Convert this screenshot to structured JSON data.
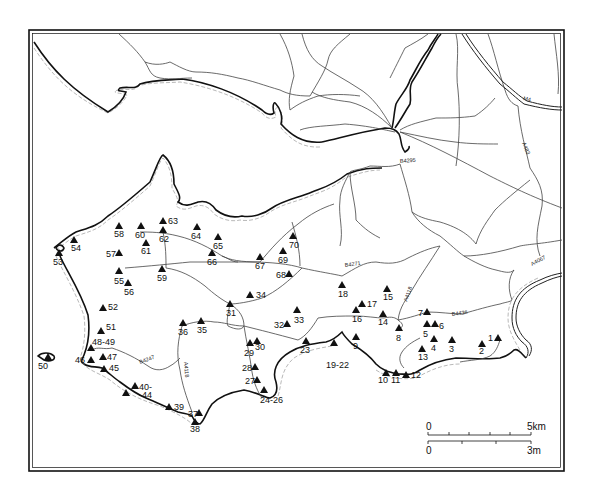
{
  "map": {
    "road_labels": {
      "m4": "M4",
      "a483": "A483",
      "b4295": "B4295",
      "b4271": "B4271",
      "a4067": "A4067",
      "a4118_north": "A4118",
      "b4436": "B4436",
      "b4247": "B4247",
      "a4118_south": "A4118"
    },
    "sites": [
      {
        "label": "1",
        "x": 498,
        "y": 338,
        "lx": 488,
        "ly": 341
      },
      {
        "label": "2",
        "x": 482,
        "y": 344,
        "lx": 479,
        "ly": 354
      },
      {
        "label": "3",
        "x": 452,
        "y": 340,
        "lx": 449,
        "ly": 352
      },
      {
        "label": "4",
        "x": 434,
        "y": 339,
        "lx": 431,
        "ly": 351
      },
      {
        "label": "5",
        "x": 427,
        "y": 324,
        "lx": 423,
        "ly": 337
      },
      {
        "label": "6",
        "x": 435,
        "y": 324,
        "lx": 439,
        "ly": 329
      },
      {
        "label": "7",
        "x": 427,
        "y": 312,
        "lx": 418,
        "ly": 316
      },
      {
        "label": "8",
        "x": 399,
        "y": 328,
        "lx": 396,
        "ly": 341
      },
      {
        "label": "9",
        "x": 356,
        "y": 337,
        "lx": 353,
        "ly": 349
      },
      {
        "label": "10",
        "x": 386,
        "y": 373,
        "lx": 378,
        "ly": 383
      },
      {
        "label": "11",
        "x": 396,
        "y": 373,
        "lx": 391,
        "ly": 383
      },
      {
        "label": "12",
        "x": 406,
        "y": 375,
        "lx": 411,
        "ly": 378
      },
      {
        "label": "13",
        "x": 422,
        "y": 349,
        "lx": 418,
        "ly": 360
      },
      {
        "label": "14",
        "x": 383,
        "y": 314,
        "lx": 378,
        "ly": 325
      },
      {
        "label": "15",
        "x": 387,
        "y": 289,
        "lx": 383,
        "ly": 300
      },
      {
        "label": "16",
        "x": 356,
        "y": 310,
        "lx": 352,
        "ly": 322
      },
      {
        "label": "17",
        "x": 362,
        "y": 304,
        "lx": 367,
        "ly": 307
      },
      {
        "label": "18",
        "x": 342,
        "y": 285,
        "lx": 338,
        "ly": 297
      },
      {
        "label": "19-22",
        "x": 334,
        "y": 343,
        "lx": 326,
        "ly": 368
      },
      {
        "label": "23",
        "x": 306,
        "y": 341,
        "lx": 300,
        "ly": 353
      },
      {
        "label": "24-26",
        "x": 264,
        "y": 390,
        "lx": 260,
        "ly": 403
      },
      {
        "label": "27",
        "x": 257,
        "y": 380,
        "lx": 245,
        "ly": 384
      },
      {
        "label": "28",
        "x": 255,
        "y": 367,
        "lx": 242,
        "ly": 371
      },
      {
        "label": "29",
        "x": 250,
        "y": 343,
        "lx": 244,
        "ly": 356
      },
      {
        "label": "30",
        "x": 257,
        "y": 341,
        "lx": 255,
        "ly": 350
      },
      {
        "label": "31",
        "x": 230,
        "y": 304,
        "lx": 226,
        "ly": 316
      },
      {
        "label": "32",
        "x": 287,
        "y": 324,
        "lx": 274,
        "ly": 328
      },
      {
        "label": "33",
        "x": 297,
        "y": 310,
        "lx": 294,
        "ly": 323
      },
      {
        "label": "34",
        "x": 250,
        "y": 295,
        "lx": 256,
        "ly": 298
      },
      {
        "label": "35",
        "x": 201,
        "y": 321,
        "lx": 197,
        "ly": 333
      },
      {
        "label": "36",
        "x": 183,
        "y": 323,
        "lx": 178,
        "ly": 335
      },
      {
        "label": "37",
        "x": 199,
        "y": 413,
        "lx": 188,
        "ly": 417
      },
      {
        "label": "38",
        "x": 195,
        "y": 422,
        "lx": 190,
        "ly": 432
      },
      {
        "label": "39",
        "x": 169,
        "y": 407,
        "lx": 174,
        "ly": 410
      },
      {
        "label": "40-",
        "x": 135,
        "y": 386,
        "lx": 139,
        "ly": 390
      },
      {
        "label": "-44",
        "x": 126,
        "y": 393,
        "lx": 139,
        "ly": 398
      },
      {
        "label": "45",
        "x": 104,
        "y": 369,
        "lx": 109,
        "ly": 371
      },
      {
        "label": "46",
        "x": 91,
        "y": 360,
        "lx": 75,
        "ly": 363
      },
      {
        "label": "47",
        "x": 103,
        "y": 357,
        "lx": 107,
        "ly": 360
      },
      {
        "label": "48-49",
        "x": 91,
        "y": 348,
        "lx": 92,
        "ly": 345
      },
      {
        "label": "50",
        "x": 48,
        "y": 357,
        "lx": 38,
        "ly": 369
      },
      {
        "label": "51",
        "x": 101,
        "y": 331,
        "lx": 106,
        "ly": 330
      },
      {
        "label": "52",
        "x": 103,
        "y": 308,
        "lx": 108,
        "ly": 310
      },
      {
        "label": "53",
        "x": 59,
        "y": 253,
        "lx": 53,
        "ly": 265
      },
      {
        "label": "54",
        "x": 74,
        "y": 240,
        "lx": 71,
        "ly": 251
      },
      {
        "label": "55",
        "x": 119,
        "y": 271,
        "lx": 114,
        "ly": 284
      },
      {
        "label": "56",
        "x": 128,
        "y": 283,
        "lx": 124,
        "ly": 295
      },
      {
        "label": "57",
        "x": 119,
        "y": 253,
        "lx": 106,
        "ly": 257
      },
      {
        "label": "58",
        "x": 119,
        "y": 226,
        "lx": 114,
        "ly": 237
      },
      {
        "label": "59",
        "x": 162,
        "y": 269,
        "lx": 157,
        "ly": 281
      },
      {
        "label": "60",
        "x": 141,
        "y": 226,
        "lx": 135,
        "ly": 238
      },
      {
        "label": "61",
        "x": 146,
        "y": 243,
        "lx": 141,
        "ly": 254
      },
      {
        "label": "62",
        "x": 163,
        "y": 230,
        "lx": 159,
        "ly": 242
      },
      {
        "label": "63",
        "x": 163,
        "y": 221,
        "lx": 168,
        "ly": 224
      },
      {
        "label": "64",
        "x": 197,
        "y": 227,
        "lx": 191,
        "ly": 239
      },
      {
        "label": "65",
        "x": 218,
        "y": 237,
        "lx": 213,
        "ly": 249
      },
      {
        "label": "66",
        "x": 212,
        "y": 253,
        "lx": 207,
        "ly": 265
      },
      {
        "label": "67",
        "x": 260,
        "y": 257,
        "lx": 255,
        "ly": 269
      },
      {
        "label": "68",
        "x": 289,
        "y": 274,
        "lx": 276,
        "ly": 278
      },
      {
        "label": "69",
        "x": 283,
        "y": 251,
        "lx": 278,
        "ly": 263
      },
      {
        "label": "70",
        "x": 293,
        "y": 236,
        "lx": 289,
        "ly": 248
      }
    ],
    "scale_bar": {
      "km_start": "0",
      "km_end": "5km",
      "mi_start": "0",
      "mi_end": "3m"
    }
  }
}
